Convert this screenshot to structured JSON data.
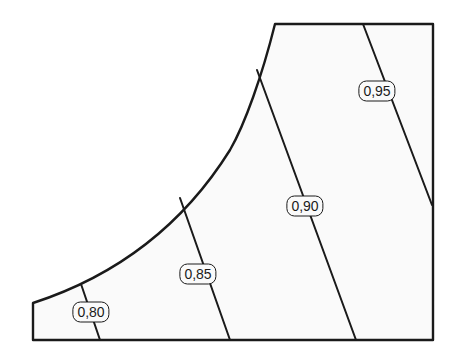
{
  "diagram": {
    "type": "contour-map",
    "boundary": {
      "bottom_left": [
        33,
        340
      ],
      "left_top": [
        33,
        303
      ],
      "curve_top": [
        275,
        24
      ],
      "top_right": [
        433,
        24
      ],
      "bottom_right": [
        433,
        340
      ]
    },
    "contours": [
      {
        "value": "0,80",
        "line": [
          [
            81,
            284
          ],
          [
            100,
            340
          ]
        ],
        "label_pos": [
          91,
          312
        ]
      },
      {
        "value": "0,85",
        "line": [
          [
            180,
            198
          ],
          [
            230,
            340
          ]
        ],
        "label_pos": [
          198,
          274
        ]
      },
      {
        "value": "0,90",
        "line": [
          [
            257,
            70
          ],
          [
            356,
            340
          ]
        ],
        "label_pos": [
          305,
          206
        ]
      },
      {
        "value": "0,95",
        "line": [
          [
            363,
            24
          ],
          [
            432,
            205
          ]
        ],
        "label_pos": [
          377,
          91
        ]
      }
    ],
    "colors": {
      "stroke": "#1a1a1a",
      "fill": "#fafafa",
      "background": "#ffffff"
    }
  }
}
